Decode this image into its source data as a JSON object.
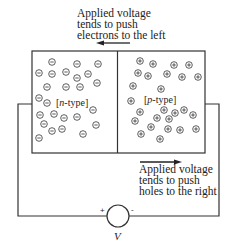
{
  "diagram": {
    "top_annotation": {
      "lines": [
        "Applied voltage",
        "tends to push",
        "electrons to the left"
      ],
      "arrow_direction": "left"
    },
    "bottom_annotation": {
      "lines": [
        "Applied voltage",
        "tends to push",
        "holes to the right"
      ],
      "arrow_direction": "right"
    },
    "n_region": {
      "label_open": "[",
      "label_italic": "n",
      "label_rest": "-type]",
      "carrier_symbol": "⊖",
      "carrier": "electron"
    },
    "p_region": {
      "label_open": "[",
      "label_italic": "p",
      "label_rest": "-type]",
      "carrier_symbol": "⊕",
      "carrier": "hole"
    },
    "source": {
      "plus": "+",
      "minus": "-",
      "label": "V"
    },
    "colors": {
      "line": "#333333",
      "background": "#ffffff"
    }
  }
}
